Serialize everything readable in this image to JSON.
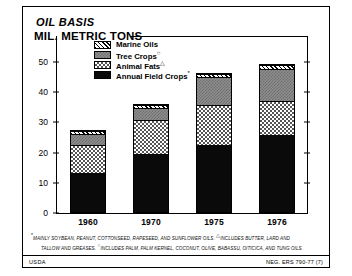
{
  "titles": {
    "line1": "OIL BASIS",
    "line2": "MIL. METRIC TONS"
  },
  "legend": {
    "items": [
      {
        "label": "Marine Oils",
        "mark": "",
        "key": "marine",
        "color": "#ffffff",
        "pattern": "diagonal-hatch"
      },
      {
        "label": "Tree Crops",
        "mark": "○",
        "key": "tree",
        "color": "#8e8e8e",
        "pattern": "fine-checker-gray"
      },
      {
        "label": "Animal Fats",
        "mark": "△",
        "key": "animal",
        "color": "#ffffff",
        "pattern": "checkerboard"
      },
      {
        "label": "Annual Field Crops",
        "mark": "*",
        "key": "field",
        "color": "#0a0a0a",
        "pattern": "solid-black"
      }
    ]
  },
  "footnotes": {
    "line1": "MAINLY SOYBEAN, PEANUT, COTTONSEED, RAPESEED, AND SUNFLOWER OILS.",
    "line1_mark": "*",
    "line1b": "INCLUDES BUTTER, LARD AND",
    "line1b_mark": "△",
    "line2": "TALLOW AND GREASES.",
    "line2b": "INCLUDES PALM, PALM KERNEL, COCONUT, OLIVE, BABASSU, OITICICA, AND TUNG OILS.",
    "line2b_mark": "○"
  },
  "footer": {
    "source": "USDA",
    "neg": "NEG. ERS 790-77 (7)"
  },
  "chart_data": {
    "type": "bar",
    "subtype": "stacked-bar",
    "xlabel": "",
    "ylabel": "MIL. METRIC TONS",
    "ylim": [
      0,
      50
    ],
    "yticks": [
      0,
      10,
      20,
      30,
      40,
      50
    ],
    "ytick_labels": [
      "0",
      "10",
      "20",
      "30",
      "40",
      "50"
    ],
    "grid": false,
    "legend_position": "inside-top-left",
    "categories": [
      "1960",
      "1970",
      "1975",
      "1976"
    ],
    "series": [
      {
        "name": "Annual Field Crops",
        "key": "field",
        "values": [
          13.6,
          20.0,
          23.0,
          26.0
        ]
      },
      {
        "name": "Animal Fats",
        "key": "animal",
        "values": [
          9.2,
          11.0,
          13.0,
          11.5
        ]
      },
      {
        "name": "Tree Crops",
        "key": "tree",
        "values": [
          3.7,
          4.0,
          9.5,
          10.5
        ]
      },
      {
        "name": "Marine Oils",
        "key": "marine",
        "values": [
          1.0,
          1.0,
          1.0,
          1.5
        ]
      }
    ],
    "totals": [
      27.5,
      36.0,
      46.5,
      49.5
    ]
  }
}
